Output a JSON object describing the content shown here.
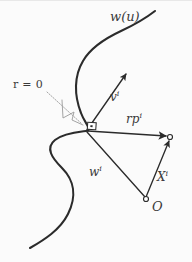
{
  "figure": {
    "background_color": "#fbfbfb",
    "ink_color": "#2b2b2b",
    "label_color": "#3a3a3a",
    "leader_color": "#8a8a8a",
    "width": 192,
    "height": 262
  },
  "labels": {
    "curve": "w(u)",
    "radius_zero": "r = 0",
    "vector_v": "v",
    "vector_v_sup": "i",
    "vector_rp": "rp",
    "vector_rp_sup": "i",
    "vector_w": "w",
    "vector_w_sup": "i",
    "vector_X": "X",
    "vector_X_sup": "i",
    "origin": "O"
  },
  "geometry": {
    "vertex_point": [
      86,
      131
    ],
    "origin_point": [
      146,
      200
    ],
    "rp_endpoint": [
      170,
      137
    ],
    "v_arrow_tip": [
      128,
      72
    ],
    "curve_path": "M 30 248 C 48 238 66 224 72 206 C 79 186 70 172 58 162 C 46 152 44 144 55 138 C 66 132 78 132 86 131 C 94 130 84 122 80 110 C 74 92 76 74 84 60 C 92 46 108 38 124 30 C 136 24 146 18 154 12",
    "rp_arrow": "M 86 131 L 168 136",
    "w_line": "M 86 131 L 144 198",
    "X_arrow": "M 145 197 L 169 139",
    "v_arrow": "M 86 131 L 127 73",
    "leader_dotted": "M 50 92 L 78 112 L 84 126",
    "right_angle_marker": [
      91,
      125
    ]
  }
}
